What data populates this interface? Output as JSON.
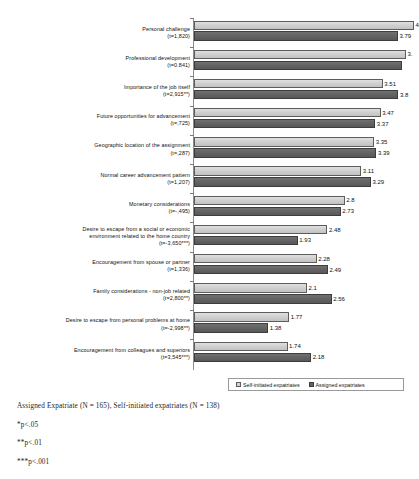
{
  "chart_data": {
    "type": "bar",
    "orientation": "horizontal",
    "title": "",
    "xlabel": "",
    "ylabel": "",
    "xlim": [
      0,
      4.15
    ],
    "grid": false,
    "legend_position": "bottom-right",
    "categories": [
      "Personal challenge\n(t=1,820)",
      "Professional development\n(t=0.841)",
      "Importance of the job itself\n(t=2,915**)",
      "Future opportunities for advancement\n(t=,725)",
      "Geographic location of the assignment\n(t=,287)",
      "Normal career advancement pattern\n(t=1,207)",
      "Monetary considerations\n(t=-,495)",
      "Desire to escape from a social or economic\nenvironment related to the home country\n(t=-3,650***)",
      "Encouragement from spouse or partner\n(t=1,336)",
      "Family considerations - non-job related\n(t=2,800**)",
      "Desire to escape from personal problems at home\n(t=-2,998**)",
      "Encouragement from colleagues and superiors\n(t=3,545***)"
    ],
    "series": [
      {
        "name": "Self-initiated expatriates",
        "color": "#cfcfcf",
        "values": [
          4.09,
          3.94,
          3.51,
          3.47,
          3.35,
          3.11,
          2.8,
          2.48,
          2.28,
          2.1,
          1.77,
          1.74
        ],
        "labels": [
          "4",
          "3.",
          "3.51",
          "3.47",
          "3.35",
          "3.11",
          "2.8",
          "2.48",
          "2.28",
          "2.1",
          "1.77",
          "1.74"
        ]
      },
      {
        "name": "Assigned expatriates",
        "color": "#636363",
        "values": [
          3.79,
          3.87,
          3.8,
          3.37,
          3.39,
          3.29,
          2.73,
          1.93,
          2.49,
          2.56,
          1.38,
          2.18
        ],
        "labels": [
          "3.79",
          "",
          "3.8",
          "3.37",
          "3.39",
          "3.29",
          "2.73",
          "1.93",
          "2.49",
          "2.56",
          "1.38",
          "2.18"
        ]
      }
    ]
  },
  "legend": {
    "items": [
      {
        "label": "Self-initiated expatriates"
      },
      {
        "label": "Assigned expatriates"
      }
    ]
  },
  "notes": [
    "Assigned Expatriate (N = 165), Self-initiated expatriates (N = 138)",
    "*p<.05",
    "**p<.01",
    "***p<.001"
  ]
}
